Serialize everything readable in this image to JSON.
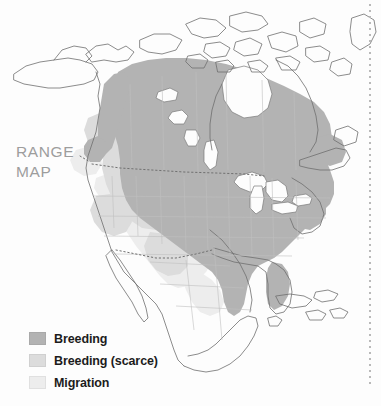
{
  "figure": {
    "caption": "RANGE\nMAP",
    "background_color": "#fdfdfd"
  },
  "map": {
    "region": "North America",
    "projection_note": "continental outline with state and province boundaries",
    "outline_color": "#6e6e6e",
    "internal_border_color": "#c2c2c2",
    "national_border_style": "dotted",
    "water_color": "#fdfdfd"
  },
  "legend": {
    "items": [
      {
        "label": "Breeding",
        "color": "#b3b3b3",
        "swatch": "breeding-swatch"
      },
      {
        "label": "Breeding (scarce)",
        "color": "#dcdcdc",
        "swatch": "breeding-scarce-swatch"
      },
      {
        "label": "Migration",
        "color": "#ededed",
        "swatch": "migration-swatch"
      }
    ]
  },
  "ranges": {
    "breeding": {
      "label": "Breeding",
      "color": "#b3b3b3",
      "extent": "Most of Canada from British Columbia east to Newfoundland, south through the Great Plains, Midwest and entire eastern United States to the Gulf Coast and Florida"
    },
    "breeding_scarce": {
      "label": "Breeding (scarce)",
      "color": "#dcdcdc",
      "extent": "Interior western United States, Great Basin, Rocky Mountain foothills and parts of the Pacific Northwest"
    },
    "migration": {
      "label": "Migration",
      "color": "#ededed",
      "extent": "Southwestern United States, Texas and northeastern Mexico"
    }
  },
  "decorations": {
    "right_rule": "dotted-vertical-rule"
  }
}
